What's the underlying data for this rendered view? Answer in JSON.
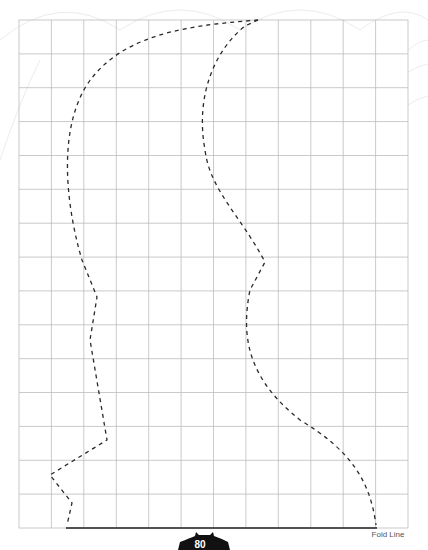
{
  "pattern": {
    "grid": {
      "cols": 12,
      "rows": 15,
      "left": 19,
      "top": 20,
      "right": 408,
      "bottom": 528,
      "line_color": "#b9b9b9"
    },
    "fold_line_label": "Fold Line",
    "page_number": "80",
    "colors": {
      "dash": "#2a2a2a",
      "fold": "#222222",
      "badge": "#111111",
      "background_pattern": "#ececec"
    }
  }
}
